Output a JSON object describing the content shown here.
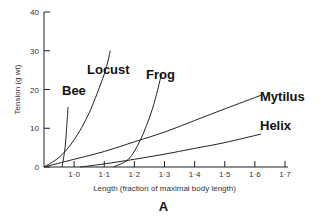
{
  "chart_data": {
    "type": "line",
    "title": "",
    "panel_label": "A",
    "xlabel": "Length (fraction of maximal body length)",
    "ylabel": "Tension (g wt)",
    "xlim": [
      0.9,
      1.7
    ],
    "ylim": [
      0,
      40
    ],
    "x_ticks": [
      "1·0",
      "1·1",
      "1·2",
      "1·3",
      "1·4",
      "1·5",
      "1·6",
      "1·7"
    ],
    "y_ticks": [
      "0",
      "10",
      "20",
      "30",
      "40"
    ],
    "grid": false,
    "legend": "inline labels",
    "series": [
      {
        "name": "Bee",
        "x": [
          0.96,
          0.97,
          0.975,
          0.98
        ],
        "y": [
          0,
          5,
          10,
          15.5
        ]
      },
      {
        "name": "Locust",
        "x": [
          0.9,
          0.95,
          1.0,
          1.05,
          1.1,
          1.12
        ],
        "y": [
          0,
          2.5,
          7,
          14,
          24,
          30
        ]
      },
      {
        "name": "Frog",
        "x": [
          1.13,
          1.18,
          1.22,
          1.26,
          1.29
        ],
        "y": [
          0,
          2,
          7,
          15,
          24
        ]
      },
      {
        "name": "Mytilus",
        "x": [
          0.9,
          1.0,
          1.1,
          1.2,
          1.3,
          1.4,
          1.5,
          1.62
        ],
        "y": [
          0,
          2,
          4,
          6.5,
          9,
          12,
          15,
          18.5
        ]
      },
      {
        "name": "Helix",
        "x": [
          1.02,
          1.1,
          1.2,
          1.3,
          1.4,
          1.5,
          1.62
        ],
        "y": [
          0,
          0.8,
          2,
          3.3,
          4.8,
          6.3,
          8.5
        ]
      }
    ]
  }
}
